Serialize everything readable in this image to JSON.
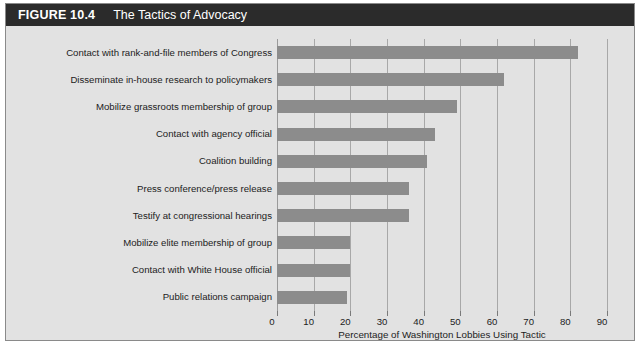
{
  "figure": {
    "number_label": "FIGURE 10.4",
    "title": "The Tactics of Advocacy"
  },
  "colors": {
    "header_bg": "#2b2b2b",
    "header_text": "#ffffff",
    "panel_bg": "#e2e2e2",
    "bar_fill": "#8c8c8c",
    "gridline": "#a8a8a8",
    "text": "#1c1c1c"
  },
  "chart_data": {
    "type": "bar",
    "orientation": "horizontal",
    "title": "The Tactics of Advocacy",
    "xlabel": "Percentage of Washington Lobbies Using Tactic",
    "ylabel": "",
    "xlim": [
      0,
      90
    ],
    "xticks": [
      0,
      10,
      20,
      30,
      40,
      50,
      60,
      70,
      80,
      90
    ],
    "xtick_labels": [
      "0",
      "10",
      "20",
      "30",
      "40",
      "50",
      "60",
      "70",
      "80",
      "90"
    ],
    "grid": true,
    "legend": false,
    "categories": [
      "Contact with rank-and-file members of Congress",
      "Disseminate in-house research to policymakers",
      "Mobilize grassroots membership of group",
      "Contact with agency official",
      "Coalition building",
      "Press conference/press release",
      "Testify at congressional hearings",
      "Mobilize elite membership of group",
      "Contact with White House official",
      "Public relations campaign"
    ],
    "values": [
      82,
      62,
      49,
      43,
      41,
      36,
      36,
      20,
      20,
      19
    ]
  }
}
